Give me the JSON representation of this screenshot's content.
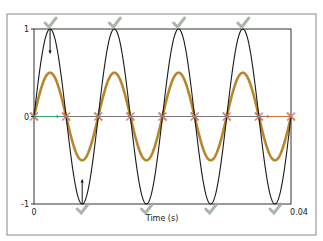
{
  "chart_data": {
    "type": "line",
    "title": "",
    "xlabel": "Time (s)",
    "ylabel": "",
    "xlim": [
      0,
      0.04
    ],
    "ylim": [
      -1,
      1
    ],
    "x_ticks": [
      {
        "value": 0,
        "label": "0"
      },
      {
        "value": 0.04,
        "label": "0.04"
      }
    ],
    "y_ticks": [
      {
        "value": 1,
        "label": "1"
      },
      {
        "value": 0,
        "label": "0"
      },
      {
        "value": -1,
        "label": "-1"
      }
    ],
    "grid": false,
    "legend": null,
    "series": [
      {
        "name": "signal",
        "color": "#1a1a1a",
        "amplitude": 1.0,
        "frequency_hz": 100,
        "phase": 0,
        "function": "sin"
      },
      {
        "name": "scaled-signal",
        "color": "#b8862c",
        "amplitude": 0.5,
        "frequency_hz": 100,
        "phase": 0,
        "function": "sin"
      }
    ],
    "annotations": {
      "peak_markers": {
        "type": "checkmark",
        "color": "#9aaa9a",
        "x": [
          0.0025,
          0.0125,
          0.0225,
          0.0325
        ],
        "y": 1
      },
      "trough_markers": {
        "type": "checkmark",
        "color": "#9aaa9a",
        "x": [
          0.0075,
          0.0175,
          0.0275,
          0.0375
        ],
        "y": -1
      },
      "zero_crossing_markers": {
        "type": "x-cross",
        "color": "#d4703c",
        "x": [
          0,
          0.005,
          0.01,
          0.015,
          0.02,
          0.025,
          0.03,
          0.035,
          0.04
        ],
        "y": 0
      },
      "arrows": [
        {
          "from": [
            0.0025,
            1
          ],
          "to": [
            0.0025,
            0.72
          ],
          "color": "#111111"
        },
        {
          "from": [
            0.0075,
            -1
          ],
          "to": [
            0.0075,
            -0.72
          ],
          "color": "#111111"
        },
        {
          "from": [
            0.0,
            0
          ],
          "to": [
            0.004,
            0
          ],
          "color": "#3aa37a"
        },
        {
          "from": [
            0.04,
            0
          ],
          "to": [
            0.036,
            0
          ],
          "color": "#d4703c"
        }
      ]
    }
  }
}
